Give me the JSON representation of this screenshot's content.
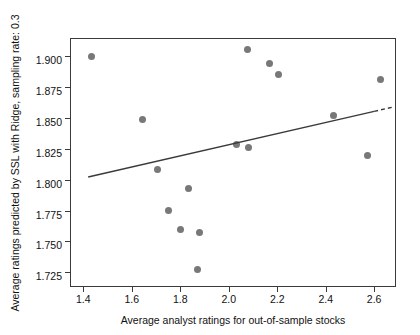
{
  "chart_data": {
    "type": "scatter",
    "title": "",
    "xlabel": "Average analyst ratings for out-of-sample stocks",
    "ylabel": "Average ratings predicted by SSL with Ridge, sampling rate: 0.3",
    "xlim": [
      1.345,
      2.69
    ],
    "ylim": [
      1.713,
      1.915
    ],
    "xticks": [
      "1.4",
      "1.6",
      "1.8",
      "2.0",
      "2.2",
      "2.4",
      "2.6"
    ],
    "xtick_values": [
      1.4,
      1.6,
      1.8,
      2.0,
      2.2,
      2.4,
      2.6
    ],
    "yticks": [
      "1.900",
      "1.875",
      "1.850",
      "1.825",
      "1.800",
      "1.775",
      "1.750",
      "1.725"
    ],
    "ytick_values": [
      1.9,
      1.875,
      1.85,
      1.825,
      1.8,
      1.775,
      1.75,
      1.725
    ],
    "grid": false,
    "legend": "none",
    "marker_color": "#787878",
    "line_color": "#3a3a3a",
    "points": [
      {
        "x": 1.433,
        "y": 1.9
      },
      {
        "x": 1.645,
        "y": 1.849
      },
      {
        "x": 1.706,
        "y": 1.808
      },
      {
        "x": 1.751,
        "y": 1.775
      },
      {
        "x": 1.8,
        "y": 1.76
      },
      {
        "x": 1.832,
        "y": 1.793
      },
      {
        "x": 1.872,
        "y": 1.727
      },
      {
        "x": 1.878,
        "y": 1.757
      },
      {
        "x": 2.031,
        "y": 1.829
      },
      {
        "x": 2.076,
        "y": 1.906
      },
      {
        "x": 2.082,
        "y": 1.826
      },
      {
        "x": 2.17,
        "y": 1.894
      },
      {
        "x": 2.204,
        "y": 1.885
      },
      {
        "x": 2.432,
        "y": 1.852
      },
      {
        "x": 2.573,
        "y": 1.82
      },
      {
        "x": 2.625,
        "y": 1.881
      }
    ],
    "fit_line": {
      "solid": {
        "x0": 1.42,
        "y0": 1.8022,
        "x1": 2.6,
        "y1": 1.8555
      },
      "dashed": {
        "x0": 2.6,
        "y0": 1.8555,
        "x1": 2.68,
        "y1": 1.8591
      }
    }
  }
}
